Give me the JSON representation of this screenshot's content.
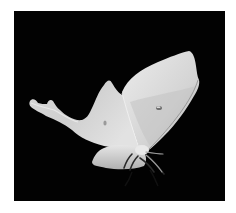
{
  "image": {
    "subject": "luna moth in flight",
    "background_color": "#020202",
    "frame_color": "#ffffff",
    "colors": {
      "wing_light": "#e6e6e6",
      "wing_mid": "#c9c9c9",
      "wing_shadow": "#a8a8a8",
      "spot": "#6f6f6f",
      "legs": "#2a2a2a"
    }
  }
}
